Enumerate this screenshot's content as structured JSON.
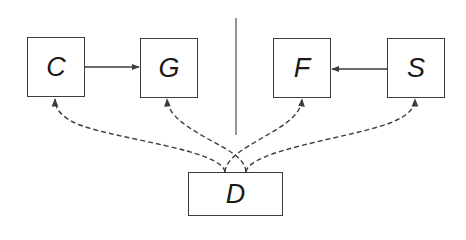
{
  "diagram": {
    "nodes": [
      {
        "id": "C",
        "label": "C",
        "x": 27,
        "y": 37,
        "w": 58,
        "h": 60
      },
      {
        "id": "G",
        "label": "G",
        "x": 140,
        "y": 38,
        "w": 58,
        "h": 60
      },
      {
        "id": "F",
        "label": "F",
        "x": 273,
        "y": 38,
        "w": 58,
        "h": 60
      },
      {
        "id": "S",
        "label": "S",
        "x": 387,
        "y": 38,
        "w": 58,
        "h": 60
      },
      {
        "id": "D",
        "label": "D",
        "x": 188,
        "y": 172,
        "w": 95,
        "h": 44
      }
    ],
    "solid_edges": [
      {
        "from": "C",
        "to": "G",
        "style": "solid"
      },
      {
        "from": "S",
        "to": "F",
        "style": "solid"
      }
    ],
    "dashed_edges": [
      {
        "from": "D",
        "to": "C",
        "style": "dashed"
      },
      {
        "from": "D",
        "to": "G",
        "style": "dashed"
      },
      {
        "from": "D",
        "to": "F",
        "style": "dashed"
      },
      {
        "from": "D",
        "to": "S",
        "style": "dashed"
      }
    ],
    "divider": {
      "orientation": "vertical",
      "x": 236,
      "y1": 18,
      "y2": 135
    },
    "colors": {
      "stroke": "#3c3c3c",
      "text": "#1a1a1a",
      "background": "#ffffff"
    }
  }
}
